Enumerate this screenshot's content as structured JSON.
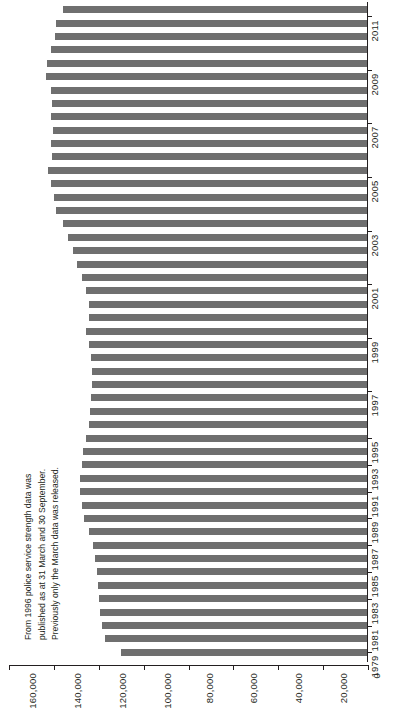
{
  "chart_data": {
    "type": "bar",
    "orientation": "horizontal",
    "title": "",
    "subtitle": "",
    "xlabel": "",
    "ylabel": "",
    "xlim": [
      0,
      160000
    ],
    "grid": false,
    "legend": null,
    "bar_color": "#6f6f6f",
    "axis_color": "#231f20",
    "value_ticks": [
      160000,
      140000,
      120000,
      100000,
      80000,
      60000,
      40000,
      20000,
      0
    ],
    "value_tick_labels": [
      "160,000",
      "140,000",
      "120,000",
      "100,000",
      "80,000",
      "60,000",
      "40,000",
      "20,000",
      "0"
    ],
    "category_ticks": [
      1979,
      1981,
      1983,
      1985,
      1987,
      1989,
      1991,
      1993,
      1995,
      1997,
      1999,
      2001,
      2003,
      2005,
      2007,
      2009,
      2011
    ],
    "category_tick_labels": [
      "1979",
      "1981",
      "1983",
      "1985",
      "1987",
      "1989",
      "1991",
      "1993",
      "1995",
      "1997",
      "1999",
      "2001",
      "2003",
      "2005",
      "2007",
      "2009",
      "2011"
    ],
    "categories": [
      "1979",
      "1980",
      "1981",
      "1982",
      "1983",
      "1984",
      "1985",
      "1986",
      "1987",
      "1988",
      "1989",
      "1990",
      "1991",
      "1992",
      "1993",
      "1994",
      "1995",
      "1996 Mar",
      "1996 Sep",
      "1997 Mar",
      "1997 Sep",
      "1998 Mar",
      "1998 Sep",
      "1999 Mar",
      "1999 Sep",
      "2000 Mar",
      "2000 Sep",
      "2001 Mar",
      "2001 Sep",
      "2002 Mar",
      "2002 Sep",
      "2003 Mar",
      "2003 Sep",
      "2004 Mar",
      "2004 Sep",
      "2005 Mar",
      "2005 Sep",
      "2006 Mar",
      "2006 Sep",
      "2007 Mar",
      "2007 Sep",
      "2008 Mar",
      "2008 Sep",
      "2009 Mar",
      "2009 Sep",
      "2010 Mar",
      "2010 Sep",
      "2011 Mar",
      "2011 Sep"
    ],
    "values": [
      110000,
      117000,
      118500,
      119500,
      120000,
      120500,
      121000,
      121500,
      122500,
      124500,
      126500,
      127500,
      128500,
      128500,
      127500,
      127000,
      125500,
      124500,
      124000,
      123500,
      123000,
      123000,
      123500,
      124500,
      125500,
      124500,
      124500,
      125500,
      127500,
      129500,
      131500,
      133500,
      136000,
      139000,
      140000,
      141500,
      142500,
      141000,
      141500,
      140500,
      141500,
      141000,
      141500,
      143500,
      143000,
      141500,
      139500,
      139000,
      136000
    ],
    "value_unit": "police officers (full-time equivalent)",
    "annotation": {
      "lines": [
        "From 1996 police service strength data was",
        "published as at 31 March and 30 September.",
        "Previously only the March data was released."
      ]
    }
  }
}
